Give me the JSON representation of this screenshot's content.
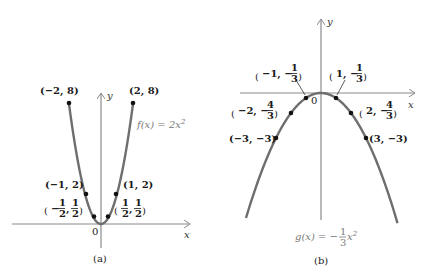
{
  "chart_data": [
    {
      "type": "line",
      "title": "(a)",
      "function_label": "f(x) = 2x²",
      "xlabel": "x",
      "ylabel": "y",
      "origin_label": "0",
      "points": [
        {
          "x": -2,
          "y": 8,
          "label": "(−2, 8)"
        },
        {
          "x": 2,
          "y": 8,
          "label": "(2, 8)"
        },
        {
          "x": -1,
          "y": 2,
          "label": "(−1, 2)"
        },
        {
          "x": 1,
          "y": 2,
          "label": "(1, 2)"
        },
        {
          "x": -0.5,
          "y": 0.5,
          "label": "(−1/2, 1/2)"
        },
        {
          "x": 0.5,
          "y": 0.5,
          "label": "(1/2, 1/2)"
        }
      ],
      "grid": false
    },
    {
      "type": "line",
      "title": "(b)",
      "function_label": "g(x) = −(1/3)x²",
      "xlabel": "x",
      "ylabel": "y",
      "origin_label": "0",
      "points": [
        {
          "x": -1,
          "y": -0.3333,
          "label": "(−1, −1/3)"
        },
        {
          "x": 1,
          "y": -0.3333,
          "label": "(1, −1/3)"
        },
        {
          "x": -2,
          "y": -1.3333,
          "label": "(−2, −4/3)"
        },
        {
          "x": 2,
          "y": -1.3333,
          "label": "(2, −4/3)"
        },
        {
          "x": -3,
          "y": -3,
          "label": "(−3, −3)"
        },
        {
          "x": 3,
          "y": -3,
          "label": "(3, −3)"
        }
      ],
      "grid": false
    }
  ],
  "panel_a": {
    "caption": "(a)",
    "fn_prefix": "f(x) = 2x",
    "fn_exp": "2",
    "x_axis": "x",
    "y_axis": "y",
    "origin": "0",
    "labels": {
      "p_m2": "(−2, 8)",
      "p_2": "(2, 8)",
      "p_m1": "(−1, 2)",
      "p_1": "(1, 2)",
      "half_num": "1",
      "half_den": "2",
      "neg": "−"
    }
  },
  "panel_b": {
    "caption": "(b)",
    "fn_prefix": "g(x) = −",
    "fn_num": "1",
    "fn_den": "3",
    "fn_var": "x",
    "fn_exp": "2",
    "x_axis": "x",
    "y_axis": "y",
    "origin": "0",
    "labels": {
      "p_m1_pre": "−1, −",
      "p_1_pre": "1, −",
      "p_m2_pre": "−2, −",
      "p_2_pre": "2, −",
      "one": "1",
      "three": "3",
      "four": "4",
      "p_m3": "(−3, −3)",
      "p_3": "(3, −3)"
    }
  },
  "colors": {
    "curve": "#6e6e6e",
    "axis": "#8a8a8a",
    "point": "#111111",
    "text": "#1a1a1a",
    "fn_text": "#7a7a7a"
  }
}
